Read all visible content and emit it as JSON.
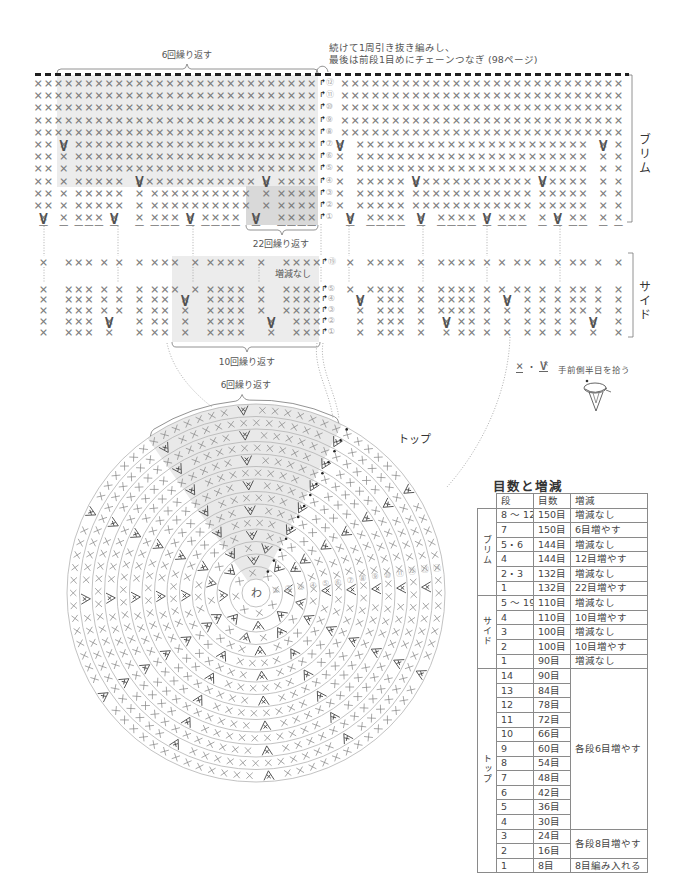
{
  "note": {
    "line1": "続けて1周引き抜き編みし、",
    "line2": "最後は前段1目めにチェーンつなぎ (98ページ)"
  },
  "symbols": {
    "row_start": "↱",
    "sc": "×",
    "inc": "∨"
  },
  "brim": {
    "label": "ブリム",
    "repeat_top_label": "6回繰り返す",
    "repeat_bottom_label": "22回繰り返す",
    "rows": [
      {
        "round": "⑫",
        "left": "× × × × × × × × × × × × × × × × × × × × × × × × × × × × ",
        "right": " × × × × × × × × × × × × × × × × × × × × × × × × × × × ×"
      },
      {
        "round": "⑪",
        "left": "× × × × × × × × × × × × × × × × × × × × × × × × × × × × ",
        "right": " × × × × × × × × × × × × × × × × × × × × × × × × × × × ×"
      },
      {
        "round": "⑩",
        "left": "× × × × × × × × × × × × × × × × × × × × × × × × × × × × ",
        "right": " × × × × × × × × × × × × × × × × × × × × × × × × × × × ×"
      },
      {
        "round": "⑨",
        "left": "× × × × × × × × × × × × × × × × × × × × × × × × × × × × ",
        "right": " × × × × × × × × × × × × × × × × × × × × × × × × × × × ×"
      },
      {
        "round": "⑧",
        "left": "× × × × × × × × × × × × × × × × × × × × × × × × × × × × ",
        "right": " × × × × × × × × × × × × × × × × × × × × × × × × × × × ×"
      },
      {
        "round": "⑦",
        "left": "× ×  ×  × × × × × × × × × × × × × × × × × × × × × × × × ",
        "left_inc": "     ∨",
        "right": "×   × × × × × × × × × × × × × × × × × × × × × × ×   ×  ×",
        "right_inc": "∨                                                   ∨"
      },
      {
        "round": "⑥",
        "left": "× ×  ×  × × × × × × × × × × × × × × × × × × × × × × × × ",
        "right": "×   × × × × × × × × × × × × × × × × × × × × × × ×   ×  ×"
      },
      {
        "round": "⑤",
        "left": "× ×  ×  × × × × × × × × × × × × × × × × × × × × × × × × ",
        "right": "×   × × × × × × × × × × × × × × × × × × × × × × ×   ×  ×"
      },
      {
        "round": "④",
        "left": "× ×  ×  × × × × ×   × × × × × × × × × × × ×  ×  × × × × ",
        "left_inc": "                    ∨                        ∨",
        "right": "×   × × × × ×  × × × × × × × × × × × ×  × × × × ×   ×  ×",
        "right_inc": "               ∨                        ∨"
      },
      {
        "round": "③",
        "left": "× ×  ×  × × × × ×   ×  × × × × × × × × × ×   ×  × × × × ",
        "right": "×   × × × × ×  × × × × × × × × × × × ×  × × × × ×   ×  ×"
      },
      {
        "round": "②",
        "left": "× ×  ×  × × × × ×   ×  × × × × × × × × × ×   ×  × × × × ",
        "right": "×   × × × × ×  × × × × × × × × × × × ×  × × × × ×   ×  ×"
      },
      {
        "round": "①",
        "left": " ×   ×  × × ×  ×    ×  × × ×  ×  × × × ×   ×    × × × × ",
        "left_inc": " ∨             ∨              ∨            ∨",
        "left_front_loop": " –   –  – – –  –    –  – – –  –  – – – –   –    – – – – ",
        "right": "  ×   × × × ×   ×   × × × ×  ×  × × ×   ×  ×  × ×   ×  ×",
        "right_inc": "  ∨             ∨            ∨             ∨",
        "right_front_loop": "  –   – – – –   –   – – – –  –  – – –   –  –  – –   –  –"
      }
    ]
  },
  "side": {
    "label": "サイド",
    "no_change_label": "増減なし",
    "repeat_bottom_label": "10回繰り返す",
    "rows": [
      {
        "round": "⑲",
        "left": " ×    × × ×  ×  ×   ×  × × ×   ×  × × × ×   ×    × × × ×",
        "right": "  ×   × × × ×   ×   × × × ×  ×  ×  × ×  ×  ×  × ×  ×   ×"
      },
      {
        "round": "⑤",
        "left": " ×    × × ×  ×  ×   ×  × × ×   ×  × × × ×   ×    × × × ×",
        "right": "  ×   × × × ×   ×   × × × ×  ×  ×  × ×  ×  ×  × ×  ×   ×"
      },
      {
        "round": "④",
        "left": " ×    × × ×  ×  ×   ×  × ×   ×    × × × ×   ×    × × × ×",
        "left_inc": "                             ∨",
        "right": "    ×   × × ×   ×   × × × ×  ×   ×   ×  ×  ×  × ×  ×   ×",
        "right_inc": "    ∨                            ∨"
      },
      {
        "round": "③",
        "left": " ×    × × ×  ×  ×   ×  × ×   ×    × × × ×   ×    × × × ×",
        "right": "    ×   × × ×   ×   × × × ×  ×   ×   ×  ×  ×  × ×  ×   ×"
      },
      {
        "round": "②",
        "left": " ×    × × ×   ×     ×  × ×   ×    × × × ×     ×    × × ×",
        "left_inc": "              ∨                               ∨",
        "right": "    ×   × × ×   ×    ×  × ×  ×   ×   ×  ×  ×  ×   ×    ×",
        "right_inc": "                     ∨                            ∨"
      },
      {
        "round": "①",
        "left": " ×    × × ×   ×     ×  × ×   ×    × × × ×     ×    × × ×",
        "right": "    ×   × × ×   ×    ×  × ×  ×   ×   ×  ×  ×  ×   ×    ×"
      }
    ]
  },
  "legend": {
    "sc_symbol": "×",
    "separator": "・",
    "inc_symbol": "∨",
    "text": "手前側半目を拾う",
    "icon": "front-half-loop-icon"
  },
  "top_chart": {
    "label": "トップ",
    "center_label": "わ",
    "repeat_label": "6回繰り返す",
    "rounds": [
      {
        "label": "①",
        "stitches": 8,
        "increases": 0
      },
      {
        "label": "②",
        "stitches": 16,
        "increases": 8
      },
      {
        "label": "③",
        "stitches": 24,
        "increases": 8
      },
      {
        "label": "④",
        "stitches": 30,
        "increases": 6
      },
      {
        "label": "⑤",
        "stitches": 36,
        "increases": 6
      },
      {
        "label": "⑥",
        "stitches": 42,
        "increases": 6
      },
      {
        "label": "⑦",
        "stitches": 48,
        "increases": 6
      },
      {
        "label": "⑧",
        "stitches": 54,
        "increases": 6
      },
      {
        "label": "⑨",
        "stitches": 60,
        "increases": 6
      },
      {
        "label": "⑩",
        "stitches": 66,
        "increases": 6
      },
      {
        "label": "⑪",
        "stitches": 72,
        "increases": 6
      },
      {
        "label": "⑫",
        "stitches": 78,
        "increases": 6
      },
      {
        "label": "⑬",
        "stitches": 84,
        "increases": 6
      },
      {
        "label": "⑭",
        "stitches": 90,
        "increases": 6
      }
    ]
  },
  "table": {
    "title": "目数と増減",
    "headers": [
      "段",
      "目数",
      "増減"
    ],
    "groups": [
      {
        "label": "ブリム",
        "rows": [
          {
            "round": "8 ～ 12",
            "stitches": "150目",
            "change": "増減なし"
          },
          {
            "round": "7",
            "stitches": "150目",
            "change": "6目増やす"
          },
          {
            "round": "5・6",
            "stitches": "144目",
            "change": "増減なし"
          },
          {
            "round": "4",
            "stitches": "144目",
            "change": "12目増やす"
          },
          {
            "round": "2・3",
            "stitches": "132目",
            "change": "増減なし"
          },
          {
            "round": "1",
            "stitches": "132目",
            "change": "22目増やす"
          }
        ]
      },
      {
        "label": "サイド",
        "rows": [
          {
            "round": "5 ～ 19",
            "stitches": "110目",
            "change": "増減なし"
          },
          {
            "round": "4",
            "stitches": "110目",
            "change": "10目増やす"
          },
          {
            "round": "3",
            "stitches": "100目",
            "change": "増減なし"
          },
          {
            "round": "2",
            "stitches": "100目",
            "change": "10目増やす"
          },
          {
            "round": "1",
            "stitches": "90目",
            "change": "増減なし"
          }
        ]
      },
      {
        "label": "トップ",
        "rows": [
          {
            "round": "14",
            "stitches": "90目",
            "change": "各段6目増やす"
          },
          {
            "round": "13",
            "stitches": "84目"
          },
          {
            "round": "12",
            "stitches": "78目"
          },
          {
            "round": "11",
            "stitches": "72目"
          },
          {
            "round": "10",
            "stitches": "66目"
          },
          {
            "round": "9",
            "stitches": "60目"
          },
          {
            "round": "8",
            "stitches": "54目"
          },
          {
            "round": "7",
            "stitches": "48目"
          },
          {
            "round": "6",
            "stitches": "42目"
          },
          {
            "round": "5",
            "stitches": "36目"
          },
          {
            "round": "4",
            "stitches": "30目"
          },
          {
            "round": "3",
            "stitches": "24目",
            "change": "各段8目増やす"
          },
          {
            "round": "2",
            "stitches": "16目"
          },
          {
            "round": "1",
            "stitches": "8目",
            "change": "8目編み入れる"
          }
        ]
      }
    ]
  }
}
